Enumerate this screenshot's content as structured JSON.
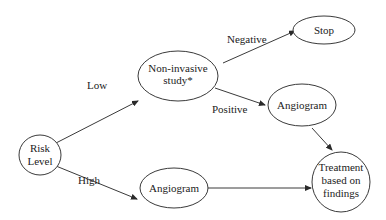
{
  "diagram": {
    "nodes": {
      "risk": {
        "lines": [
          "Risk",
          "Level"
        ]
      },
      "study": {
        "lines": [
          "Non-invasive",
          "study*"
        ]
      },
      "stop": {
        "lines": [
          "Stop"
        ]
      },
      "angio_pos": {
        "lines": [
          "Angiogram"
        ]
      },
      "angio_high": {
        "lines": [
          "Angiogram"
        ]
      },
      "treatment": {
        "lines": [
          "Treatment",
          "based on",
          "findings"
        ]
      }
    },
    "edges": {
      "low": "Low",
      "high": "High",
      "negative": "Negative",
      "positive": "Positive"
    }
  }
}
